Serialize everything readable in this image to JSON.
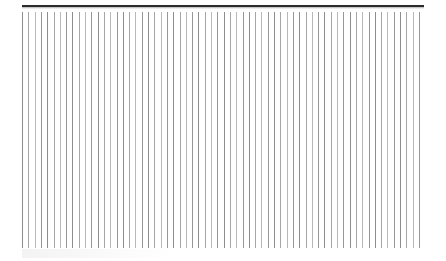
{
  "canvas": {
    "width": 446,
    "height": 261,
    "background_color": "#ffffff"
  },
  "top_rule": {
    "label": "horizontal-rule",
    "color": "#2b2b2b",
    "x": 22,
    "y": 5,
    "width": 402,
    "thickness": 2
  },
  "hatch_field": {
    "label": "vertical-hatch-pattern",
    "x": 22,
    "y": 12,
    "width": 402,
    "height": 236,
    "line_count": 64,
    "pitch": 6.3,
    "line_width": 1,
    "colors": [
      "#8d8d8d",
      "#a6a6a6",
      "#b8b8b8",
      "#979797"
    ]
  },
  "artifact": {
    "label": "compression-ghosting",
    "x": 22,
    "y": 249,
    "width": 150,
    "height": 9,
    "color": "#b4b4b9"
  }
}
